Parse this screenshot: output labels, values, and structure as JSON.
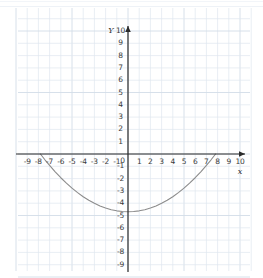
{
  "chart_data": {
    "type": "line",
    "title": "",
    "xlabel": "x",
    "ylabel": "Y",
    "xlim": [
      -9.8,
      10.6
    ],
    "ylim": [
      -9.8,
      10.4
    ],
    "grid": true,
    "legend": "none",
    "equation": "y = x^2/13 - 4.7",
    "vertex": [
      0,
      -4.7
    ],
    "x_intercepts": [
      -7.8,
      7.8
    ],
    "series": [
      {
        "name": "parabola",
        "color": "#8c8c8c",
        "x": [
          -7.82,
          -7.4,
          -7.0,
          -6.5,
          -6.0,
          -5.5,
          -5.0,
          -4.5,
          -4.0,
          -3.5,
          -3.0,
          -2.5,
          -2.0,
          -1.5,
          -1.0,
          -0.5,
          0,
          0.5,
          1.0,
          1.5,
          2.0,
          2.5,
          3.0,
          3.5,
          4.0,
          4.5,
          5.0,
          5.5,
          6.0,
          6.5,
          7.0,
          7.4,
          7.82
        ],
        "y": [
          0,
          -0.49,
          -0.92,
          -1.45,
          -1.93,
          -2.37,
          -2.78,
          -3.14,
          -3.47,
          -3.76,
          -4.01,
          -4.22,
          -4.39,
          -4.53,
          -4.62,
          -4.68,
          -4.7,
          -4.68,
          -4.62,
          -4.53,
          -4.39,
          -4.22,
          -4.01,
          -3.76,
          -3.47,
          -3.14,
          -2.78,
          -2.37,
          -1.93,
          -1.45,
          -0.92,
          -0.49,
          0
        ]
      }
    ],
    "x_ticks": [
      -9,
      -8,
      -7,
      -6,
      -5,
      -4,
      -3,
      -2,
      -1,
      0,
      1,
      2,
      3,
      4,
      5,
      6,
      7,
      8,
      9,
      10
    ],
    "y_ticks": [
      10,
      9,
      8,
      7,
      6,
      5,
      4,
      3,
      2,
      1,
      -1,
      -2,
      -3,
      -4,
      -5,
      -6,
      -7,
      -8,
      -9
    ],
    "x_tick_labels": [
      "-9",
      "-8",
      "-7",
      "-6",
      "-5",
      "-4",
      "-3",
      "-2",
      "-1",
      "0",
      "1",
      "2",
      "3",
      "4",
      "5",
      "6",
      "7",
      "8",
      "9",
      "10"
    ],
    "y_tick_labels": [
      "10",
      "9",
      "8",
      "7",
      "6",
      "5",
      "4",
      "3",
      "2",
      "1",
      "-1",
      "-2",
      "-3",
      "-4",
      "-5",
      "-6",
      "-7",
      "-8",
      "-9"
    ],
    "origin_label": "0"
  },
  "axis_labels": {
    "x_axis_name": "x",
    "y_axis_name": "Y"
  },
  "colors": {
    "grid": "#dfe6ef",
    "grid_strong": "#d3dce8",
    "axis": "#2b2b2b",
    "curve": "#8c8c8c",
    "text": "#3a3a3a",
    "background": "#ffffff"
  }
}
